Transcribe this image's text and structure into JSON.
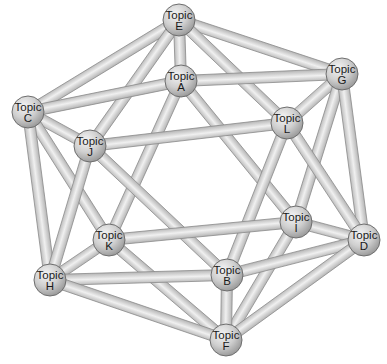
{
  "diagram": {
    "type": "network-graph",
    "shape": "icosahedron",
    "colors": {
      "background": "#ffffff",
      "edge_fill": "#d9d9d9",
      "edge_stroke": "#8a8a8a",
      "node_light": "#f2f2f2",
      "node_dark": "#9a9a9a",
      "node_stroke": "#6e6e6e",
      "label": "#1a1a1a"
    },
    "nodes": [
      {
        "id": "E",
        "line1": "Topic",
        "line2": "E",
        "x": 179,
        "y": 20
      },
      {
        "id": "A",
        "line1": "Topic",
        "line2": "A",
        "x": 181,
        "y": 81
      },
      {
        "id": "G",
        "line1": "Topic",
        "line2": "G",
        "x": 342,
        "y": 74
      },
      {
        "id": "C",
        "line1": "Topic",
        "line2": "C",
        "x": 28,
        "y": 112
      },
      {
        "id": "J",
        "line1": "Topic",
        "line2": "J",
        "x": 90,
        "y": 146
      },
      {
        "id": "L",
        "line1": "Topic",
        "line2": "L",
        "x": 287,
        "y": 123
      },
      {
        "id": "I",
        "line1": "Topic",
        "line2": "I",
        "x": 296,
        "y": 222
      },
      {
        "id": "D",
        "line1": "Topic",
        "line2": "D",
        "x": 364,
        "y": 240
      },
      {
        "id": "K",
        "line1": "Topic",
        "line2": "K",
        "x": 109,
        "y": 240
      },
      {
        "id": "H",
        "line1": "Topic",
        "line2": "H",
        "x": 50,
        "y": 280
      },
      {
        "id": "B",
        "line1": "Topic",
        "line2": "B",
        "x": 227,
        "y": 275
      },
      {
        "id": "F",
        "line1": "Topic",
        "line2": "F",
        "x": 226,
        "y": 340
      }
    ],
    "edges": [
      [
        "E",
        "C"
      ],
      [
        "E",
        "J"
      ],
      [
        "E",
        "A"
      ],
      [
        "E",
        "G"
      ],
      [
        "E",
        "L"
      ],
      [
        "A",
        "C"
      ],
      [
        "A",
        "G"
      ],
      [
        "A",
        "K"
      ],
      [
        "A",
        "I"
      ],
      [
        "C",
        "J"
      ],
      [
        "C",
        "K"
      ],
      [
        "C",
        "H"
      ],
      [
        "J",
        "L"
      ],
      [
        "J",
        "H"
      ],
      [
        "J",
        "B"
      ],
      [
        "G",
        "L"
      ],
      [
        "G",
        "I"
      ],
      [
        "G",
        "D"
      ],
      [
        "L",
        "D"
      ],
      [
        "L",
        "B"
      ],
      [
        "I",
        "D"
      ],
      [
        "I",
        "K"
      ],
      [
        "I",
        "F"
      ],
      [
        "K",
        "H"
      ],
      [
        "K",
        "F"
      ],
      [
        "H",
        "B"
      ],
      [
        "H",
        "F"
      ],
      [
        "B",
        "F"
      ],
      [
        "B",
        "D"
      ],
      [
        "D",
        "F"
      ]
    ]
  }
}
